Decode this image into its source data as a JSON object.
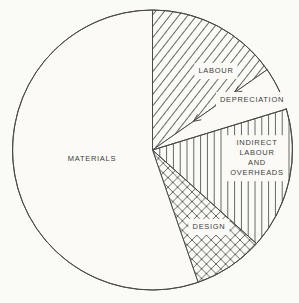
{
  "figure": {
    "paper_color": "#fbfaf7",
    "line_color": "#4a4a4a",
    "hatch_color": "#565656",
    "text_color": "#3c3c3c"
  },
  "chart_data": {
    "type": "pie",
    "title": "",
    "legend": "none",
    "cx": 152.5,
    "cy": 150,
    "radius": 140,
    "segments": [
      {
        "label": "LABOUR",
        "slug": "labour",
        "start_angle_deg": 0,
        "end_angle_deg": 55,
        "percent_approx": 15.3,
        "pattern": "diagonal",
        "label_pos": {
          "x": 216,
          "y": 71
        }
      },
      {
        "label": "DEPRECIATION",
        "slug": "depreciation",
        "start_angle_deg": 55,
        "end_angle_deg": 73,
        "percent_approx": 5.0,
        "pattern": "none",
        "label_pos": {
          "x": 252,
          "y": 100
        }
      },
      {
        "label": "INDIRECT\nLABOUR\nAND\nOVERHEADS",
        "slug": "indirect-labour-and-overheads",
        "start_angle_deg": 73,
        "end_angle_deg": 132,
        "percent_approx": 16.4,
        "pattern": "vertical",
        "label_pos": {
          "x": 257,
          "y": 158
        }
      },
      {
        "label": "DESIGN",
        "slug": "design",
        "start_angle_deg": 132,
        "end_angle_deg": 161,
        "percent_approx": 8.1,
        "pattern": "crosshatch",
        "label_pos": {
          "x": 209,
          "y": 227
        }
      },
      {
        "label": "MATERIALS",
        "slug": "materials",
        "start_angle_deg": 161,
        "end_angle_deg": 360,
        "percent_approx": 55.2,
        "pattern": "none",
        "label_pos": {
          "x": 92,
          "y": 159
        }
      }
    ],
    "annotations": [
      {
        "type": "arrowheads_on_boundary",
        "boundary_angle_deg": 55,
        "radii": [
          50,
          100
        ],
        "direction": "inward"
      }
    ]
  }
}
